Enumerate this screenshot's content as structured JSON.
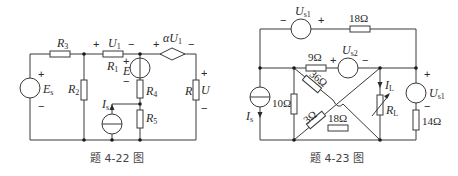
{
  "figures": [
    {
      "caption": "题 4-22 图",
      "labels": {
        "R3": "R",
        "R3_sub": "3",
        "R1": "R",
        "R1_sub": "1",
        "R2": "R",
        "R2_sub": "2",
        "R4": "R",
        "R4_sub": "4",
        "R5": "R",
        "R5_sub": "5",
        "R": "R",
        "U": "U",
        "U1": "U",
        "U1_sub": "1",
        "aU1": "αU",
        "aU1_sub": "1",
        "Es": "E",
        "Es_sub": "s",
        "E": "E",
        "Is": "I",
        "Is_sub": "s",
        "plus": "+",
        "minus": "−"
      }
    },
    {
      "caption": "题 4-23 图",
      "labels": {
        "Us1_top": "U",
        "Us1_top_sub": "s1",
        "Us2": "U",
        "Us2_sub": "s2",
        "Us1_right": "U",
        "Us1_right_sub": "s1",
        "IL": "I",
        "IL_sub": "L",
        "RL": "R",
        "RL_sub": "L",
        "Is": "I",
        "Is_sub": "s",
        "r18_top": "18Ω",
        "r9": "9Ω",
        "r36": "36Ω",
        "r10": "10Ω",
        "r3": "3Ω",
        "r18_bottom": "18Ω",
        "r14": "14Ω",
        "plus": "+",
        "minus": "−"
      }
    }
  ]
}
